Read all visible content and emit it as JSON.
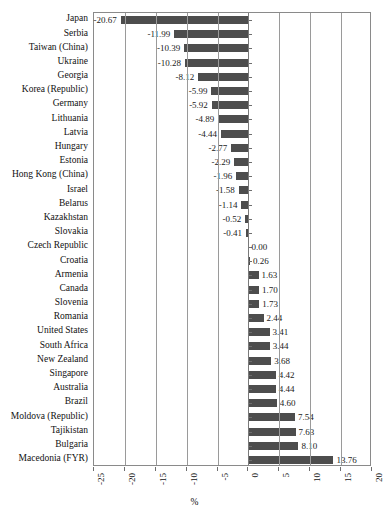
{
  "chart_data": {
    "type": "bar",
    "orientation": "horizontal",
    "title": "",
    "xlabel": "%",
    "ylabel": "",
    "xlim": [
      -25,
      20
    ],
    "xticks": [
      -25,
      -20,
      -15,
      -10,
      -5,
      0,
      5,
      10,
      15,
      20
    ],
    "xtick_labels": [
      "-25",
      "-20",
      "-15",
      "-10",
      "-5",
      "0",
      "5",
      "10",
      "15",
      "20"
    ],
    "grid": true,
    "grid_axis": "x",
    "legend": null,
    "bar_color": "#4d4d4d",
    "data_labels": true,
    "categories": [
      "Japan",
      "Serbia",
      "Taiwan (China)",
      "Ukraine",
      "Georgia",
      "Korea (Republic)",
      "Germany",
      "Lithuania",
      "Latvia",
      "Hungary",
      "Estonia",
      "Hong Kong (China)",
      "Israel",
      "Belarus",
      "Kazakhstan",
      "Slovakia",
      "Czech Republic",
      "Croatia",
      "Armenia",
      "Canada",
      "Slovenia",
      "Romania",
      "United States",
      "South Africa",
      "New Zealand",
      "Singapore",
      "Australia",
      "Brazil",
      "Moldova (Republic)",
      "Tajikistan",
      "Bulgaria",
      "Macedonia (FYR)"
    ],
    "values": [
      -20.67,
      -11.99,
      -10.39,
      -10.28,
      -8.12,
      -5.99,
      -5.92,
      -4.89,
      -4.44,
      -2.77,
      -2.29,
      -1.96,
      -1.58,
      -1.14,
      -0.52,
      -0.41,
      0.0,
      0.26,
      1.63,
      1.7,
      1.73,
      2.44,
      3.41,
      3.44,
      3.68,
      4.42,
      4.44,
      4.6,
      7.54,
      7.63,
      8.1,
      13.76
    ],
    "value_labels": [
      "-20.67",
      "-11.99",
      "-10.39",
      "-10.28",
      "-8.12",
      "-5.99",
      "-5.92",
      "-4.89",
      "-4.44",
      "-2.77",
      "-2.29",
      "-1.96",
      "-1.58",
      "-1.14",
      "-0.52",
      "-0.41",
      "0.00",
      "0.26",
      "1.63",
      "1.70",
      "1.73",
      "2.44",
      "3.41",
      "3.44",
      "3.68",
      "4.42",
      "4.44",
      "4.60",
      "7.54",
      "7.63",
      "8.10",
      "13.76"
    ]
  }
}
